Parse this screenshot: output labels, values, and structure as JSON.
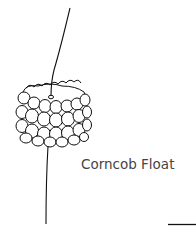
{
  "figure": {
    "caption": "Corncob Float",
    "colors": {
      "line": "#111111",
      "text": "#444444",
      "background": "#ffffff"
    }
  }
}
